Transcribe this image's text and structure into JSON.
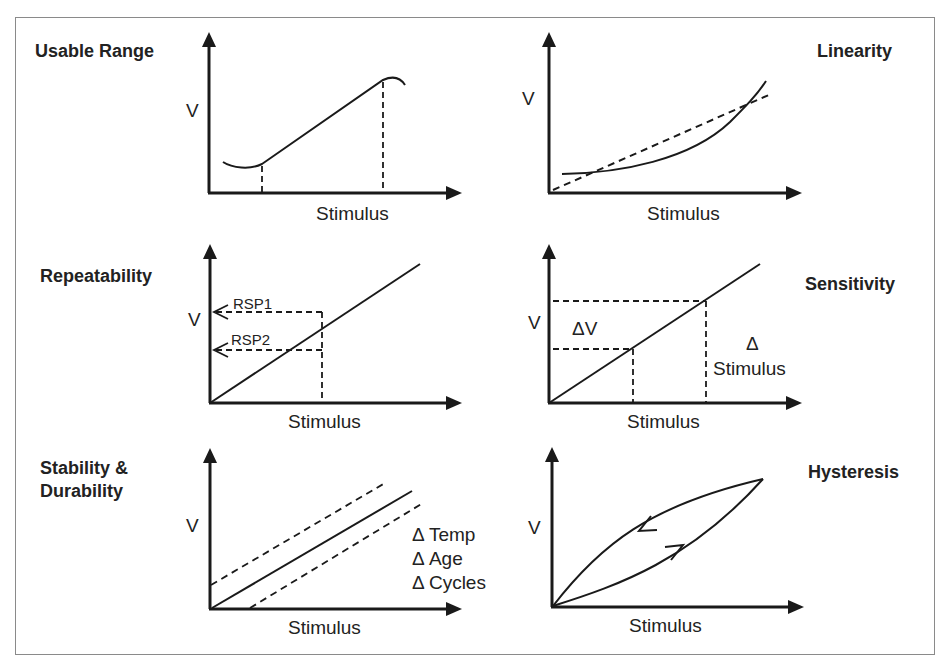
{
  "figure": {
    "panels": [
      {
        "id": "usable-range",
        "title": "Usable Range",
        "y_label": "V",
        "x_label": "Stimulus",
        "description": "Nonlinear response curve with a linear usable region bounded by two dashed vertical markers"
      },
      {
        "id": "linearity",
        "title": "Linearity",
        "y_label": "V",
        "x_label": "Stimulus",
        "description": "Actual (solid, curved) response compared to ideal linear (dashed) response"
      },
      {
        "id": "repeatability",
        "title": "Repeatability",
        "y_label": "V",
        "x_label": "Stimulus",
        "annotations": [
          "RSP1",
          "RSP2"
        ],
        "description": "Same stimulus producing two different responses RSP1 and RSP2"
      },
      {
        "id": "sensitivity",
        "title": "Sensitivity",
        "y_label": "V",
        "x_label": "Stimulus",
        "annotations": [
          "ΔV",
          "Δ",
          "Stimulus"
        ],
        "description": "Slope of response: ΔV over Δ Stimulus"
      },
      {
        "id": "stability-durability",
        "title_line1": "Stability &",
        "title_line2": "Durability",
        "y_label": "V",
        "x_label": "Stimulus",
        "annotations": [
          "Δ Temp",
          "Δ Age",
          "Δ Cycles"
        ],
        "description": "Nominal response (solid) with drift bands (dashed) due to temperature, age and cycles"
      },
      {
        "id": "hysteresis",
        "title": "Hysteresis",
        "y_label": "V",
        "x_label": "Stimulus",
        "description": "Loading and unloading curves form a loop; arrows indicate direction"
      }
    ]
  },
  "colors": {
    "line": "#1a1a1a",
    "frame": "#8a8a8a",
    "background": "#ffffff"
  }
}
